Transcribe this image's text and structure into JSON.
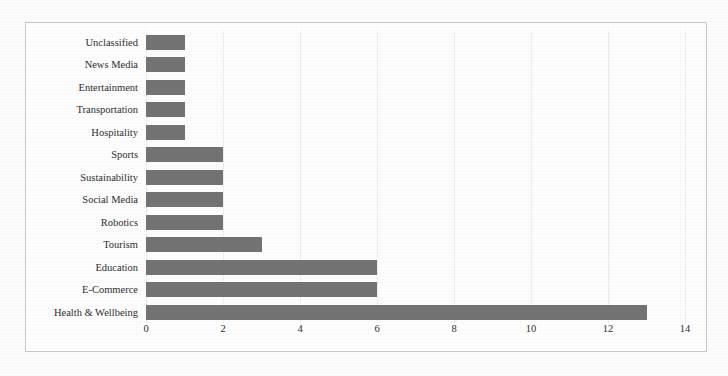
{
  "chart_data": {
    "type": "bar",
    "orientation": "horizontal",
    "title": "",
    "xlabel": "",
    "ylabel": "",
    "xlim": [
      0,
      14
    ],
    "xticks": [
      0,
      2,
      4,
      6,
      8,
      10,
      12,
      14
    ],
    "grid": true,
    "legend": false,
    "bar_color": "#737373",
    "categories": [
      "Unclassified",
      "News Media",
      "Entertainment",
      "Transportation",
      "Hospitality",
      "Sports",
      "Sustainability",
      "Social Media",
      "Robotics",
      "Tourism",
      "Education",
      "E-Commerce",
      "Health & Wellbeing"
    ],
    "values": [
      1,
      1,
      1,
      1,
      1,
      2,
      2,
      2,
      2,
      3,
      6,
      6,
      13
    ]
  },
  "frame": {
    "border_color": "#c9c9c9",
    "background": "#fdfdfd"
  }
}
